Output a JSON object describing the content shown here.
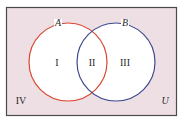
{
  "diagram": {
    "type": "venn",
    "colors": {
      "universe_fill": "#eedfe5",
      "universe_border": "#4a4a4a",
      "set_fill": "#ffffff",
      "set_a_stroke": "#d8472e",
      "set_b_stroke": "#3d4a8e"
    },
    "universe_label": "U",
    "sets": [
      {
        "name": "A",
        "label": "A"
      },
      {
        "name": "B",
        "label": "B"
      }
    ],
    "regions": [
      {
        "id": "I",
        "label": "I",
        "description": "A only"
      },
      {
        "id": "II",
        "label": "II",
        "description": "A and B"
      },
      {
        "id": "III",
        "label": "III",
        "description": "B only"
      },
      {
        "id": "IV",
        "label": "IV",
        "description": "neither A nor B"
      }
    ]
  }
}
